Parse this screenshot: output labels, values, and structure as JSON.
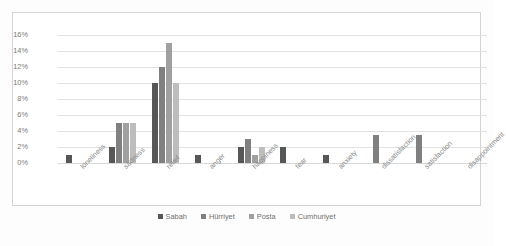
{
  "chart_data": {
    "type": "bar",
    "title": "",
    "xlabel": "",
    "ylabel": "",
    "ylim": [
      0,
      16
    ],
    "ytick_labels": [
      "16%",
      "14%",
      "12%",
      "10%",
      "8%",
      "6%",
      "4%",
      "2%",
      "0%"
    ],
    "ytick_values": [
      16,
      14,
      12,
      10,
      8,
      6,
      4,
      2,
      0
    ],
    "grid": true,
    "legend_position": "bottom-center",
    "categories": [
      "loneliness",
      "sadness",
      "relief",
      "anger",
      "happiness",
      "fear",
      "anxiety",
      "dissatisfaction",
      "satisfaction",
      "disappointment"
    ],
    "series": [
      {
        "name": "Sabah",
        "color": "#575757",
        "values": [
          1,
          2,
          10,
          1,
          2,
          2,
          1,
          0,
          0,
          0
        ]
      },
      {
        "name": "Hürriyet",
        "color": "#808080",
        "values": [
          0,
          5,
          12,
          0,
          3,
          0,
          0,
          3.5,
          3.5,
          0
        ]
      },
      {
        "name": "Posta",
        "color": "#a0a0a0",
        "values": [
          0,
          5,
          15,
          0,
          1,
          0,
          0,
          0,
          0,
          0
        ]
      },
      {
        "name": "Cumhuriyet",
        "color": "#bdbdbd",
        "values": [
          0,
          5,
          10,
          0,
          2,
          0,
          0,
          0,
          0,
          0
        ]
      }
    ]
  },
  "legend": {
    "items": [
      {
        "label": "Sabah"
      },
      {
        "label": "Hürriyet"
      },
      {
        "label": "Posta"
      },
      {
        "label": "Cumhuriyet"
      }
    ]
  }
}
